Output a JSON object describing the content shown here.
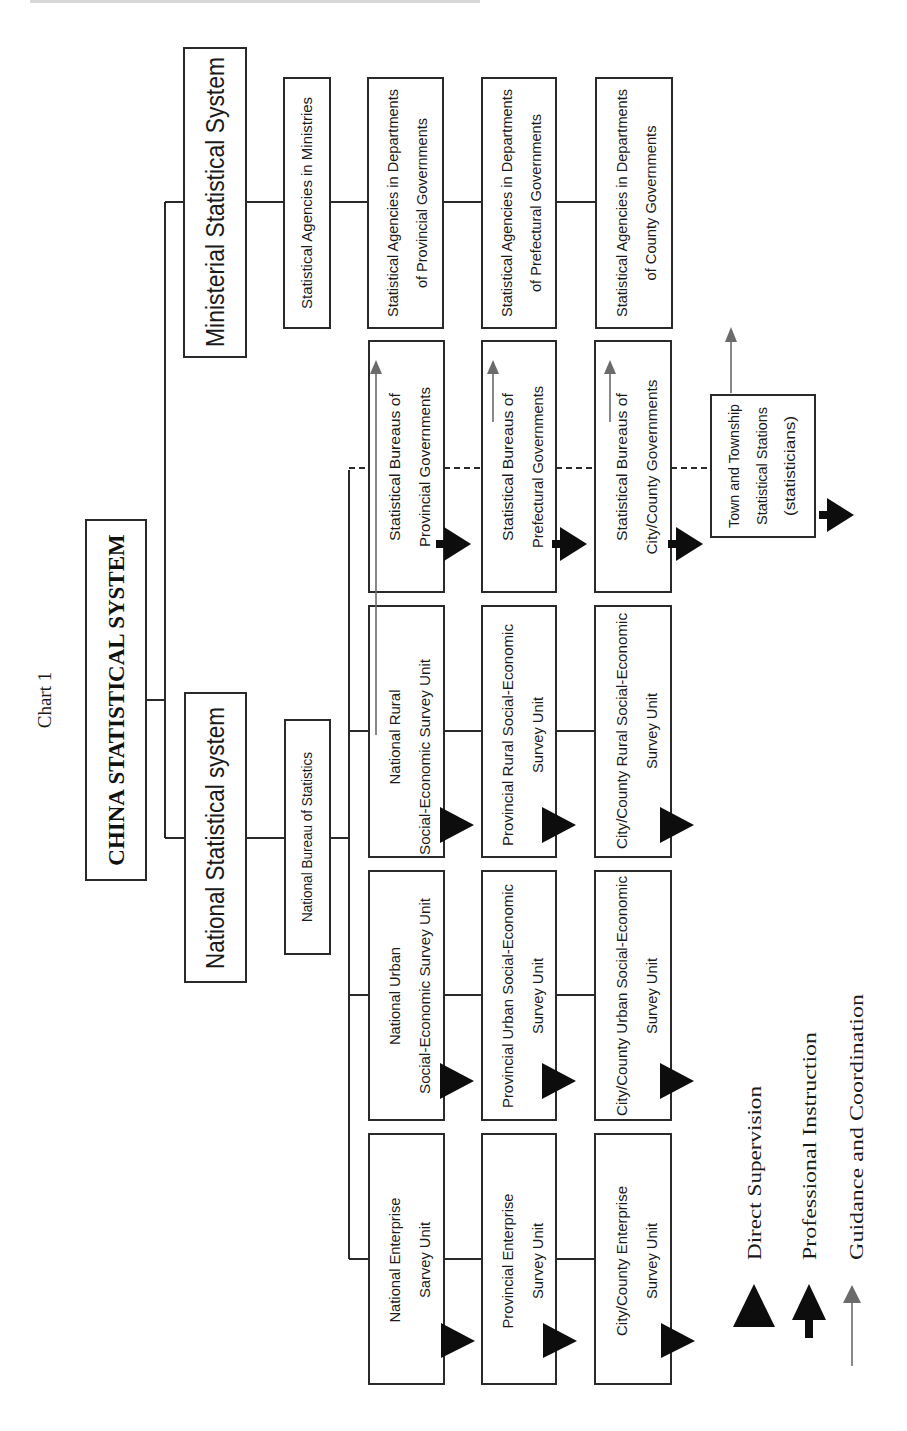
{
  "chart_label": "Chart 1",
  "root": {
    "label": "CHINA STATISTICAL SYSTEM"
  },
  "branches": {
    "national": {
      "label": "National Statistical system"
    },
    "ministerial": {
      "label": "Ministerial Statistical System"
    }
  },
  "nbs": {
    "label": "National Bureau of Statistics"
  },
  "ministerial_chain": [
    {
      "lines": [
        "Statistical Agencies in Ministries"
      ]
    },
    {
      "lines": [
        "Statistical Agencies in Departments",
        "of Provincial Governments"
      ]
    },
    {
      "lines": [
        "Statistical Agencies in Departments",
        "of Prefectural Governments"
      ]
    },
    {
      "lines": [
        "Statistical Agencies in Departments",
        "of County Governments"
      ]
    }
  ],
  "bureaus_chain": [
    {
      "lines": [
        "Statistical Bureaus of",
        "Provincial Governments"
      ]
    },
    {
      "lines": [
        "Statistical Bureaus of",
        "Prefectural Governments"
      ]
    },
    {
      "lines": [
        "Statistical Bureaus of",
        "City/County Governments"
      ]
    }
  ],
  "town": {
    "lines": [
      "Town and Township",
      "Statistical Stations",
      "(statisticians)"
    ]
  },
  "rural_chain": [
    {
      "lines": [
        "National Rural",
        "Social-Economic Survey Unit"
      ]
    },
    {
      "lines": [
        "Provincial Rural Social-Economic",
        "Survey Unit"
      ]
    },
    {
      "lines": [
        "City/County Rural Social-Economic",
        "Survey Unit"
      ]
    }
  ],
  "urban_chain": [
    {
      "lines": [
        "National Urban",
        "Social-Economic Survey Unit"
      ]
    },
    {
      "lines": [
        "Provincial Urban Social-Economic",
        "Survey Unit"
      ]
    },
    {
      "lines": [
        "City/County Urban Social-Economic",
        "Survey Unit"
      ]
    }
  ],
  "enterprise_chain": [
    {
      "lines": [
        "National Enterprise",
        "Sarvey Unit"
      ]
    },
    {
      "lines": [
        "Provincial Enterprise",
        "Survey Unit"
      ]
    },
    {
      "lines": [
        "City/County Enterprise",
        "Survey Unit"
      ]
    }
  ],
  "legend": [
    {
      "icon": "solid-triangle-icon",
      "label": "Direct Supervision"
    },
    {
      "icon": "thick-arrow-icon",
      "label": "Professional Instruction"
    },
    {
      "icon": "thin-arrow-icon",
      "label": "Guidance and Coordination"
    }
  ],
  "colors": {
    "line": "#2a2a2a",
    "guidance": "#6b6b6b",
    "supervision": "#0d0d0d",
    "background": "#ffffff"
  }
}
